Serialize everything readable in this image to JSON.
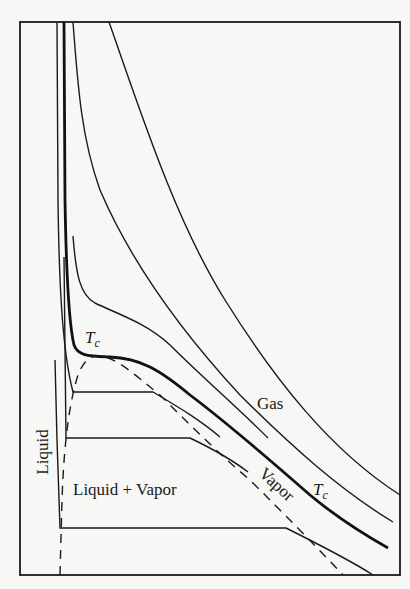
{
  "diagram": {
    "labels": {
      "gas": "Gas",
      "liquid": "Liquid",
      "liquid_vapor": "Liquid + Vapor",
      "vapor": "Vapor",
      "tc_upper_main": "T",
      "tc_upper_sub": "c",
      "tc_lower_main": "T",
      "tc_lower_sub": "c"
    },
    "colors": {
      "ink": "#1a1a1a",
      "paper": "#f7f7f5"
    },
    "elements": [
      "frame",
      "isotherm-high-1",
      "isotherm-high-2",
      "isotherm-above-critical",
      "critical-isotherm",
      "isotherm-below-critical-1",
      "isotherm-below-critical-2",
      "isotherm-below-critical-3",
      "coexistence-dome-dashed"
    ]
  }
}
